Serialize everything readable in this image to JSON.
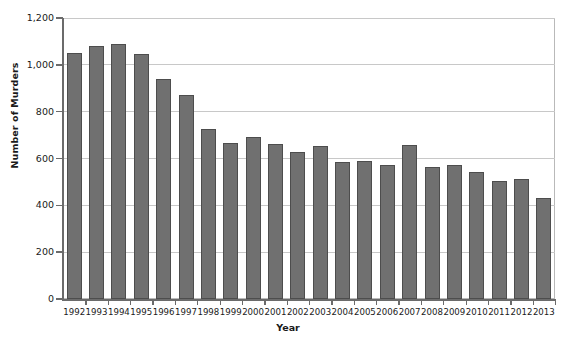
{
  "chart_data": {
    "type": "bar",
    "title": "",
    "xlabel": "Year",
    "ylabel": "Number of Murders",
    "categories": [
      "1992",
      "1993",
      "1994",
      "1995",
      "1996",
      "1997",
      "1998",
      "1999",
      "2000",
      "2001",
      "2002",
      "2003",
      "2004",
      "2005",
      "2006",
      "2007",
      "2008",
      "2009",
      "2010",
      "2011",
      "2012",
      "2013"
    ],
    "values": [
      1050,
      1080,
      1088,
      1046,
      938,
      872,
      725,
      668,
      690,
      660,
      628,
      652,
      585,
      591,
      573,
      658,
      562,
      573,
      544,
      506,
      511,
      433
    ],
    "ylim": [
      0,
      1200
    ],
    "ytick_values": [
      0,
      200,
      400,
      600,
      800,
      1000,
      1200
    ],
    "ytick_labels": [
      "0",
      "200",
      "400",
      "600",
      "800",
      "1,000",
      "1,200"
    ],
    "grid": true,
    "legend": false,
    "legend_position": "none",
    "series": [
      {
        "name": "Number of Murders",
        "values": [
          1050,
          1080,
          1088,
          1046,
          938,
          872,
          725,
          668,
          690,
          660,
          628,
          652,
          585,
          591,
          573,
          658,
          562,
          573,
          544,
          506,
          511,
          433
        ]
      }
    ]
  },
  "style": {
    "bar_fill": "#707070",
    "bar_stroke": "#4d4d4d",
    "grid_color": "#c8c8c8",
    "axis_color": "#6b6b6b",
    "frame_color": "#b9b9b9",
    "background": "#ffffff",
    "text_color": "#1a1a1a"
  }
}
